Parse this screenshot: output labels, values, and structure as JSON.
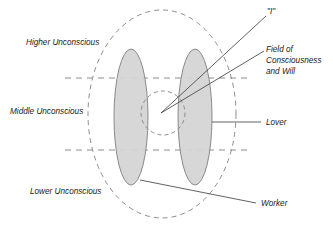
{
  "diagram": {
    "background_color": "#ffffff",
    "stroke_color": "#8e8e8e",
    "fill_color": "#d4d4d4",
    "leader_color": "#3a3a3a",
    "labels": {
      "higher_unconscious": "Higher Unconscious",
      "middle_unconscious": "Middle Unconscious",
      "lower_unconscious": "Lower Unconscious",
      "self_i": "\"I\"",
      "field_line_1": "Field of",
      "field_line_2": "Consciousness",
      "field_line_3": "and Will",
      "lover": "Lover",
      "worker": "Worker"
    }
  }
}
